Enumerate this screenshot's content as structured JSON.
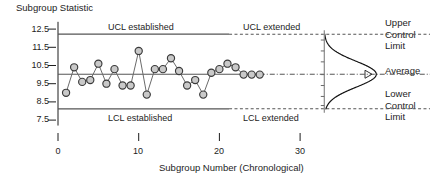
{
  "chart_data": {
    "type": "scatter",
    "title": "",
    "ylabel": "Subgroup Statistic",
    "xlabel": "Subgroup Number (Chronological)",
    "ylim": [
      7.2,
      12.9
    ],
    "xlim": [
      0,
      34.5
    ],
    "yticks": [
      12.5,
      11.5,
      10.5,
      9.5,
      8.5,
      7.5
    ],
    "ytick_labels": [
      "12.5",
      "11.5",
      "10.5",
      "9.5",
      "8.5",
      "7.5"
    ],
    "xticks": [
      0,
      10,
      20,
      30
    ],
    "xtick_labels": [
      "0",
      "10",
      "20",
      "30"
    ],
    "grid": false,
    "legend": "none",
    "limits": {
      "ucl": 12.22,
      "average": 10.02,
      "lcl": 8.12,
      "established_until_x": 21.2
    },
    "series": [
      {
        "name": "Subgroup Statistic",
        "marker": "filled-circle",
        "x": [
          1,
          2,
          3,
          4,
          5,
          6,
          7,
          8,
          9,
          10,
          11,
          12,
          13,
          14,
          15,
          16,
          17,
          18,
          19,
          20,
          21,
          22,
          23,
          24,
          25
        ],
        "values": [
          9.0,
          10.4,
          9.6,
          9.7,
          10.6,
          9.5,
          10.3,
          9.4,
          9.4,
          11.3,
          8.9,
          10.3,
          10.3,
          10.9,
          10.2,
          9.4,
          9.7,
          8.9,
          10.1,
          10.3,
          10.6,
          10.4,
          10.0,
          10.0,
          10.0
        ]
      }
    ],
    "annotations": [
      {
        "name": "ucl-established",
        "text": "UCL established",
        "x": 10.5,
        "y": 12.62
      },
      {
        "name": "ucl-extended",
        "text": "UCL extended",
        "x": 27.0,
        "y": 12.62
      },
      {
        "name": "lcl-established",
        "text": "LCL established",
        "x": 10.5,
        "y": 7.62
      },
      {
        "name": "lcl-extended",
        "text": "LCL extended",
        "x": 27.0,
        "y": 7.62
      }
    ],
    "distribution": {
      "name": "normal-curve",
      "orientation": "vertical",
      "mean": 10.02,
      "sigma": 0.72,
      "baseline_x": 33.0
    }
  },
  "labels": {
    "y_axis_title": "Subgroup Statistic",
    "x_axis_title": "Subgroup Number (Chronological)",
    "ucl_established": "UCL established",
    "ucl_extended": "UCL extended",
    "lcl_established": "LCL established",
    "lcl_extended": "LCL extended",
    "upper_control_limit": [
      "Upper",
      "Control",
      "Limit"
    ],
    "average": "Average",
    "lower_control_limit": [
      "Lower",
      "Control",
      "Limit"
    ],
    "ytick_0": "12.5",
    "ytick_1": "11.5",
    "ytick_2": "10.5",
    "ytick_3": "9.5",
    "ytick_4": "8.5",
    "ytick_5": "7.5",
    "xtick_0": "0",
    "xtick_1": "10",
    "xtick_2": "20",
    "xtick_3": "30"
  },
  "colors": {
    "ink": "#1d1d1d",
    "line": "#5a5a5a",
    "marker_fill": "#c9c9c9",
    "marker_edge": "#3a3a3a",
    "limit_line": "#555555"
  }
}
